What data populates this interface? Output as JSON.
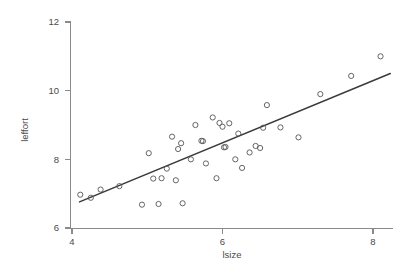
{
  "chart_data": {
    "type": "scatter",
    "title": "",
    "subtitle": "",
    "xlabel": "lsize",
    "ylabel": "leffort",
    "xlim": [
      3.77,
      8.28
    ],
    "ylim": [
      5.83,
      12.3
    ],
    "xticks": [
      4,
      6,
      8
    ],
    "xtick_labels": [
      "4",
      "6",
      "8"
    ],
    "yticks": [
      6,
      8,
      10,
      12
    ],
    "ytick_labels": [
      "6",
      "8",
      "10",
      "12"
    ],
    "grid": false,
    "legend": null,
    "legend_position": "none",
    "marker": "open-circle",
    "marker_color": "#555555",
    "line_color": "#3a3a3a",
    "axis_color": "#8a8a8a",
    "background": "#ffffff",
    "points": [
      {
        "x": 4.11,
        "y": 6.97
      },
      {
        "x": 4.25,
        "y": 6.88
      },
      {
        "x": 4.38,
        "y": 7.12
      },
      {
        "x": 4.63,
        "y": 7.22
      },
      {
        "x": 4.93,
        "y": 6.68
      },
      {
        "x": 5.02,
        "y": 8.18
      },
      {
        "x": 5.08,
        "y": 7.44
      },
      {
        "x": 5.15,
        "y": 6.7
      },
      {
        "x": 5.19,
        "y": 7.45
      },
      {
        "x": 5.26,
        "y": 7.73
      },
      {
        "x": 5.33,
        "y": 8.66
      },
      {
        "x": 5.38,
        "y": 7.39
      },
      {
        "x": 5.41,
        "y": 8.3
      },
      {
        "x": 5.45,
        "y": 8.47
      },
      {
        "x": 5.47,
        "y": 6.72
      },
      {
        "x": 5.58,
        "y": 8.0
      },
      {
        "x": 5.64,
        "y": 9.0
      },
      {
        "x": 5.72,
        "y": 8.54
      },
      {
        "x": 5.74,
        "y": 8.53
      },
      {
        "x": 5.78,
        "y": 7.88
      },
      {
        "x": 5.87,
        "y": 9.22
      },
      {
        "x": 5.92,
        "y": 7.45
      },
      {
        "x": 5.96,
        "y": 9.06
      },
      {
        "x": 6.0,
        "y": 8.95
      },
      {
        "x": 6.02,
        "y": 8.35
      },
      {
        "x": 6.04,
        "y": 8.36
      },
      {
        "x": 6.09,
        "y": 9.05
      },
      {
        "x": 6.17,
        "y": 8.0
      },
      {
        "x": 6.21,
        "y": 8.75
      },
      {
        "x": 6.26,
        "y": 7.75
      },
      {
        "x": 6.36,
        "y": 8.2
      },
      {
        "x": 6.44,
        "y": 8.39
      },
      {
        "x": 6.5,
        "y": 8.33
      },
      {
        "x": 6.54,
        "y": 8.92
      },
      {
        "x": 6.59,
        "y": 9.58
      },
      {
        "x": 6.77,
        "y": 8.93
      },
      {
        "x": 7.01,
        "y": 8.64
      },
      {
        "x": 7.3,
        "y": 9.9
      },
      {
        "x": 7.71,
        "y": 10.43
      },
      {
        "x": 8.1,
        "y": 11.0
      }
    ],
    "fit_line": {
      "label": "least-squares fit",
      "x_start": 4.1,
      "y_start": 6.76,
      "x_end": 8.23,
      "y_end": 10.5,
      "slope": 0.905,
      "intercept": 3.05
    }
  }
}
